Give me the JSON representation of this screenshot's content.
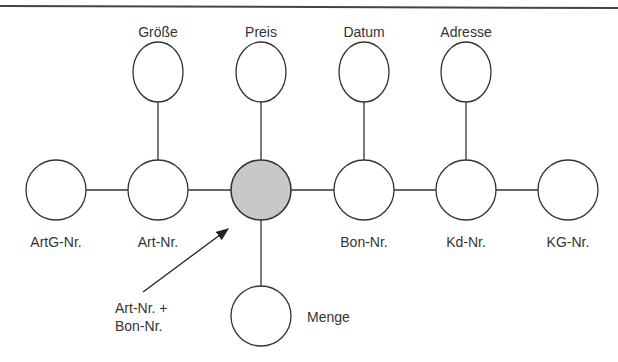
{
  "diagram": {
    "type": "star-schema",
    "center_node": {
      "id": "fact",
      "label": "Art-Nr. + Bon-Nr.",
      "fill": "#c8c8c8"
    },
    "nodes": [
      {
        "id": "groesse",
        "label": "Größe",
        "x": 158,
        "y": 72
      },
      {
        "id": "preis",
        "label": "Preis",
        "x": 261,
        "y": 72
      },
      {
        "id": "datum",
        "label": "Datum",
        "x": 364,
        "y": 72
      },
      {
        "id": "adresse",
        "label": "Adresse",
        "x": 466,
        "y": 72
      },
      {
        "id": "artg",
        "label": "ArtG-Nr.",
        "x": 56,
        "y": 190
      },
      {
        "id": "art",
        "label": "Art-Nr.",
        "x": 158,
        "y": 190
      },
      {
        "id": "fact",
        "label": "",
        "x": 261,
        "y": 190
      },
      {
        "id": "bon",
        "label": "Bon-Nr.",
        "x": 364,
        "y": 190
      },
      {
        "id": "kd",
        "label": "Kd-Nr.",
        "x": 466,
        "y": 190
      },
      {
        "id": "kg",
        "label": "KG-Nr.",
        "x": 568,
        "y": 190
      },
      {
        "id": "menge",
        "label": "Menge",
        "x": 261,
        "y": 316
      }
    ],
    "edges": [
      [
        "artg",
        "art"
      ],
      [
        "art",
        "fact"
      ],
      [
        "fact",
        "bon"
      ],
      [
        "bon",
        "kd"
      ],
      [
        "kd",
        "kg"
      ],
      [
        "groesse",
        "art"
      ],
      [
        "preis",
        "fact"
      ],
      [
        "datum",
        "bon"
      ],
      [
        "adresse",
        "kd"
      ],
      [
        "fact",
        "menge"
      ]
    ],
    "annotation": {
      "line1": "Art-Nr. +",
      "line2": "Bon-Nr.",
      "points_to": "fact"
    }
  },
  "labels": {
    "groesse": "Größe",
    "preis": "Preis",
    "datum": "Datum",
    "adresse": "Adresse",
    "artg": "ArtG-Nr.",
    "art": "Art-Nr.",
    "bon": "Bon-Nr.",
    "kd": "Kd-Nr.",
    "kg": "KG-Nr.",
    "menge": "Menge",
    "annotation_line1": "Art-Nr. +",
    "annotation_line2": "Bon-Nr."
  },
  "colors": {
    "stroke": "#333333",
    "fact_fill": "#c8c8c8",
    "node_fill": "#ffffff"
  }
}
